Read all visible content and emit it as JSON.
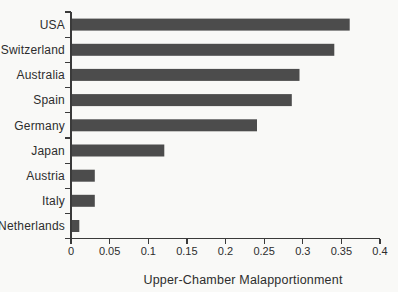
{
  "figure": {
    "background_color": "#f9f9f7",
    "bar_color": "#4c4c4c",
    "axis_color": "#3a3a3a",
    "text_color": "#2d2d2d"
  },
  "chart_data": {
    "type": "bar",
    "orientation": "horizontal",
    "title": "",
    "xlabel": "Upper-Chamber Malapportionment",
    "ylabel": "",
    "categories": [
      "USA",
      "Switzerland",
      "Australia",
      "Spain",
      "Germany",
      "Japan",
      "Austria",
      "Italy",
      "Netherlands"
    ],
    "values": [
      0.36,
      0.34,
      0.295,
      0.285,
      0.24,
      0.12,
      0.03,
      0.03,
      0.01
    ],
    "xlim": [
      0,
      0.4
    ],
    "xticks": [
      0,
      0.05,
      0.1,
      0.15,
      0.2,
      0.25,
      0.3,
      0.35,
      0.4
    ],
    "xtick_labels": [
      "0",
      "0.05",
      "0.1",
      "0.15",
      "0.2",
      "0.25",
      "0.3",
      "0.35",
      "0.4"
    ],
    "grid": false,
    "legend": null
  }
}
